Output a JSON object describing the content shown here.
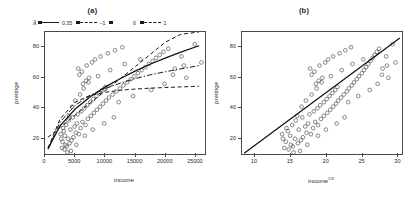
{
  "figure": {
    "panels": [
      {
        "id": "a",
        "title": "(a)",
        "xlabel": "income",
        "ylabel": "prestige",
        "x_ticks": [
          "0",
          "5000",
          "10000",
          "15000",
          "20000",
          "25000"
        ],
        "y_ticks": [
          "20",
          "40",
          "60",
          "80"
        ]
      },
      {
        "id": "b",
        "title": "(b)",
        "xlabel_base": "income",
        "xlabel_sup": "1/3",
        "ylabel": "prestige",
        "x_ticks": [
          "10",
          "15",
          "20",
          "25",
          "30"
        ],
        "y_ticks": [
          "20",
          "40",
          "60",
          "80"
        ]
      }
    ],
    "legend": {
      "symbol": "λ",
      "entries": [
        {
          "label": "0.35",
          "style": "solid"
        },
        {
          "label": "−1",
          "style": "dash"
        },
        {
          "label": "0",
          "style": "dashdot"
        },
        {
          "label": "1",
          "style": "dash"
        }
      ]
    }
  },
  "chart_data": [
    {
      "type": "scatter",
      "panel": "a",
      "title": "(a)",
      "xlabel": "income",
      "ylabel": "prestige",
      "xlim": [
        0,
        26500
      ],
      "ylim": [
        10,
        90
      ],
      "xticks": [
        0,
        5000,
        10000,
        15000,
        20000,
        25000
      ],
      "yticks": [
        20,
        40,
        60,
        80
      ],
      "grid": false,
      "legend": "top, outside above plot",
      "points": [
        [
          2800,
          14
        ],
        [
          3200,
          13
        ],
        [
          3400,
          16
        ],
        [
          2900,
          18
        ],
        [
          3600,
          15
        ],
        [
          4100,
          17
        ],
        [
          3800,
          20
        ],
        [
          4400,
          19
        ],
        [
          3300,
          22
        ],
        [
          4700,
          21
        ],
        [
          5100,
          24
        ],
        [
          4200,
          26
        ],
        [
          5600,
          23
        ],
        [
          4900,
          28
        ],
        [
          5300,
          30
        ],
        [
          3900,
          32
        ],
        [
          5900,
          27
        ],
        [
          6200,
          31
        ],
        [
          4600,
          34
        ],
        [
          6700,
          29
        ],
        [
          5400,
          36
        ],
        [
          7100,
          33
        ],
        [
          6000,
          38
        ],
        [
          7600,
          35
        ],
        [
          6500,
          40
        ],
        [
          8100,
          37
        ],
        [
          7000,
          42
        ],
        [
          8600,
          39
        ],
        [
          7500,
          44
        ],
        [
          9100,
          41
        ],
        [
          8000,
          46
        ],
        [
          9600,
          43
        ],
        [
          8500,
          48
        ],
        [
          10100,
          45
        ],
        [
          9000,
          50
        ],
        [
          10600,
          47
        ],
        [
          9500,
          52
        ],
        [
          11200,
          49
        ],
        [
          10000,
          54
        ],
        [
          11800,
          51
        ],
        [
          6300,
          56
        ],
        [
          12400,
          53
        ],
        [
          6800,
          58
        ],
        [
          13000,
          55
        ],
        [
          7300,
          60
        ],
        [
          13600,
          57
        ],
        [
          5700,
          62
        ],
        [
          14200,
          59
        ],
        [
          6100,
          64
        ],
        [
          14800,
          61
        ],
        [
          5500,
          66
        ],
        [
          15400,
          63
        ],
        [
          6900,
          68
        ],
        [
          16000,
          65
        ],
        [
          7800,
          70
        ],
        [
          16600,
          67
        ],
        [
          8300,
          72
        ],
        [
          17200,
          69
        ],
        [
          9200,
          74
        ],
        [
          17800,
          71
        ],
        [
          10400,
          76
        ],
        [
          18400,
          73
        ],
        [
          11600,
          78
        ],
        [
          19000,
          75
        ],
        [
          12800,
          80
        ],
        [
          19600,
          77
        ],
        [
          3100,
          25
        ],
        [
          3500,
          29
        ],
        [
          4000,
          35
        ],
        [
          4500,
          41
        ],
        [
          5000,
          45
        ],
        [
          5800,
          49
        ],
        [
          6400,
          53
        ],
        [
          7200,
          57
        ],
        [
          8800,
          61
        ],
        [
          10800,
          65
        ],
        [
          13200,
          69
        ],
        [
          15800,
          72
        ],
        [
          20400,
          79
        ],
        [
          21500,
          66
        ],
        [
          24800,
          82
        ],
        [
          25900,
          70
        ],
        [
          22600,
          74
        ],
        [
          23400,
          60
        ],
        [
          4300,
          12
        ],
        [
          3700,
          11
        ],
        [
          2700,
          20
        ],
        [
          2600,
          23
        ],
        [
          3000,
          27
        ],
        [
          5200,
          16
        ],
        [
          6600,
          22
        ],
        [
          7900,
          26
        ],
        [
          9800,
          30
        ],
        [
          11400,
          34
        ],
        [
          12200,
          44
        ],
        [
          14600,
          48
        ],
        [
          17600,
          52
        ],
        [
          19800,
          56
        ],
        [
          21200,
          62
        ],
        [
          23000,
          68
        ]
      ],
      "curves": [
        {
          "name": "λ = 0.35",
          "style": "solid",
          "lambda": 0.35,
          "description": "estimated power transformation, moderately concave",
          "x": [
            500,
            2500,
            5000,
            7500,
            10000,
            12500,
            15000,
            17500,
            20000,
            22500,
            25500
          ],
          "y": [
            13.5,
            28.5,
            39.5,
            47.5,
            54.0,
            59.5,
            64.5,
            69.0,
            73.0,
            76.8,
            81.0
          ]
        },
        {
          "name": "λ = −1",
          "style": "dash",
          "lambda": -1,
          "description": "inverse transformation, strongly concave, flattens early",
          "x": [
            500,
            2500,
            5000,
            7500,
            10000,
            12500,
            15000,
            17500,
            20000,
            22500,
            25500
          ],
          "y": [
            14.0,
            33.0,
            44.0,
            48.5,
            50.5,
            51.8,
            52.6,
            53.2,
            53.6,
            54.0,
            54.4
          ]
        },
        {
          "name": "λ = 0",
          "style": "dashdot",
          "lambda": 0,
          "description": "log transformation, concave between −1 and 0.35",
          "x": [
            500,
            2500,
            5000,
            7500,
            10000,
            12500,
            15000,
            17500,
            20000,
            22500,
            25500
          ],
          "y": [
            13.0,
            31.0,
            42.0,
            48.5,
            53.0,
            56.5,
            59.5,
            62.0,
            64.0,
            65.8,
            68.0
          ]
        },
        {
          "name": "λ = 1",
          "style": "dash",
          "lambda": 1,
          "description": "identity / linear, steepest at high income",
          "x": [
            500,
            2500,
            5000,
            7500,
            10000,
            12500,
            15000,
            17500,
            20000,
            22500,
            25500
          ],
          "y": [
            21.0,
            27.5,
            35.5,
            43.5,
            51.5,
            59.5,
            67.5,
            75.5,
            83.5,
            88.5,
            90.0
          ]
        }
      ]
    },
    {
      "type": "scatter",
      "panel": "b",
      "title": "(b)",
      "xlabel": "income^(1/3)",
      "ylabel": "prestige",
      "xlim": [
        8.2,
        30.5
      ],
      "ylim": [
        10,
        90
      ],
      "xticks": [
        10,
        15,
        20,
        25,
        30
      ],
      "yticks": [
        20,
        40,
        60,
        80
      ],
      "grid": false,
      "points": [
        [
          14.1,
          14
        ],
        [
          14.7,
          13
        ],
        [
          15.0,
          16
        ],
        [
          14.3,
          18
        ],
        [
          15.3,
          15
        ],
        [
          16.0,
          17
        ],
        [
          15.6,
          20
        ],
        [
          16.4,
          19
        ],
        [
          14.9,
          22
        ],
        [
          16.7,
          21
        ],
        [
          17.2,
          24
        ],
        [
          16.1,
          26
        ],
        [
          17.8,
          23
        ],
        [
          17.0,
          28
        ],
        [
          17.4,
          30
        ],
        [
          15.7,
          32
        ],
        [
          18.1,
          27
        ],
        [
          18.4,
          31
        ],
        [
          16.6,
          34
        ],
        [
          18.8,
          29
        ],
        [
          17.6,
          36
        ],
        [
          19.2,
          33
        ],
        [
          18.2,
          38
        ],
        [
          19.6,
          35
        ],
        [
          18.7,
          40
        ],
        [
          20.1,
          37
        ],
        [
          19.1,
          42
        ],
        [
          20.5,
          39
        ],
        [
          19.6,
          44
        ],
        [
          20.9,
          41
        ],
        [
          20.0,
          46
        ],
        [
          21.3,
          43
        ],
        [
          20.4,
          48
        ],
        [
          21.6,
          45
        ],
        [
          20.8,
          50
        ],
        [
          22.0,
          47
        ],
        [
          21.2,
          52
        ],
        [
          22.4,
          49
        ],
        [
          21.5,
          54
        ],
        [
          22.8,
          51
        ],
        [
          18.5,
          56
        ],
        [
          23.1,
          53
        ],
        [
          18.9,
          58
        ],
        [
          23.5,
          55
        ],
        [
          19.4,
          60
        ],
        [
          23.8,
          57
        ],
        [
          17.9,
          62
        ],
        [
          24.2,
          59
        ],
        [
          18.3,
          64
        ],
        [
          24.5,
          61
        ],
        [
          17.7,
          66
        ],
        [
          24.9,
          63
        ],
        [
          19.0,
          68
        ],
        [
          25.2,
          65
        ],
        [
          19.8,
          70
        ],
        [
          25.5,
          67
        ],
        [
          20.2,
          72
        ],
        [
          25.8,
          69
        ],
        [
          20.9,
          74
        ],
        [
          26.1,
          71
        ],
        [
          21.8,
          76
        ],
        [
          26.4,
          73
        ],
        [
          22.6,
          78
        ],
        [
          26.7,
          75
        ],
        [
          23.4,
          80
        ],
        [
          27.0,
          77
        ],
        [
          14.6,
          25
        ],
        [
          15.2,
          29
        ],
        [
          15.9,
          35
        ],
        [
          16.5,
          41
        ],
        [
          17.1,
          45
        ],
        [
          17.9,
          49
        ],
        [
          18.6,
          53
        ],
        [
          19.3,
          57
        ],
        [
          20.6,
          61
        ],
        [
          22.1,
          65
        ],
        [
          23.6,
          69
        ],
        [
          25.1,
          72
        ],
        [
          27.3,
          79
        ],
        [
          27.8,
          66
        ],
        [
          29.2,
          82
        ],
        [
          29.6,
          70
        ],
        [
          28.3,
          74
        ],
        [
          28.6,
          60
        ],
        [
          16.3,
          12
        ],
        [
          15.4,
          11
        ],
        [
          13.9,
          20
        ],
        [
          13.8,
          23
        ],
        [
          14.4,
          27
        ],
        [
          17.3,
          16
        ],
        [
          18.8,
          22
        ],
        [
          19.9,
          26
        ],
        [
          21.4,
          30
        ],
        [
          22.5,
          34
        ],
        [
          23.0,
          44
        ],
        [
          24.4,
          48
        ],
        [
          26.0,
          52
        ],
        [
          27.1,
          56
        ],
        [
          27.7,
          62
        ],
        [
          28.4,
          68
        ]
      ],
      "curves": [
        {
          "name": "fitted line",
          "style": "solid",
          "description": "straight regression line through linearized data",
          "x": [
            8.5,
            30.2
          ],
          "y": [
            10.5,
            86.0
          ]
        }
      ]
    }
  ]
}
